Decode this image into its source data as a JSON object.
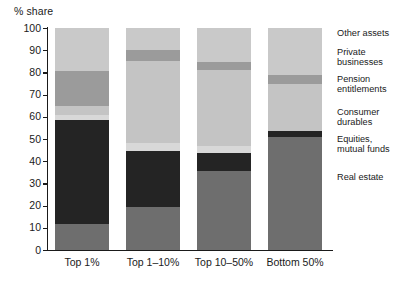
{
  "chart_data": {
    "type": "bar",
    "stacked": true,
    "title": "",
    "subtitle": "",
    "xlabel": "",
    "ylabel": "% share",
    "ylim": [
      0,
      100
    ],
    "yticks": [
      0,
      10,
      20,
      30,
      40,
      50,
      60,
      70,
      80,
      90,
      100
    ],
    "grid": false,
    "legend_position": "right",
    "categories": [
      "Top 1%",
      "Top 1–10%",
      "Top 10–50%",
      "Bottom 50%"
    ],
    "series": [
      {
        "name": "Real estate",
        "color": "#6e6e6e",
        "values": [
          11.5,
          19.5,
          35.5,
          51.0
        ]
      },
      {
        "name": "Equities,\nmutual funds",
        "color": "#242424",
        "values": [
          47.0,
          25.0,
          8.0,
          2.5
        ]
      },
      {
        "name": "Consumer\ndurables",
        "color": "#d8d8d8",
        "values": [
          2.5,
          3.5,
          3.5,
          0.0
        ]
      },
      {
        "name": "Pension\nentitlements",
        "color": "#c4c4c4",
        "values": [
          4.0,
          37.0,
          34.0,
          21.5
        ]
      },
      {
        "name": "Private\nbusinesses",
        "color": "#9b9b9b",
        "values": [
          15.5,
          5.0,
          3.5,
          4.0
        ]
      },
      {
        "name": "Other assets",
        "color": "#c9c9c9",
        "values": [
          19.5,
          10.0,
          15.5,
          21.0
        ]
      }
    ],
    "legend_entries": [
      "Other assets",
      "Private\nbusinesses",
      "Pension\nentitlements",
      "Consumer\ndurables",
      "Equities,\nmutual funds",
      "Real estate"
    ]
  },
  "axis": {
    "y_title": "% share",
    "tick_labels": [
      "100",
      "90",
      "80",
      "70",
      "60",
      "50",
      "40",
      "30",
      "20",
      "10",
      "0"
    ]
  },
  "colors": {
    "axis": "#1a1a1a",
    "background": "#ffffff",
    "real_estate": "#6e6e6e",
    "equities": "#242424",
    "consumer_durables": "#d8d8d8",
    "pension": "#c4c4c4",
    "private_businesses": "#9b9b9b",
    "other_assets": "#c9c9c9"
  }
}
